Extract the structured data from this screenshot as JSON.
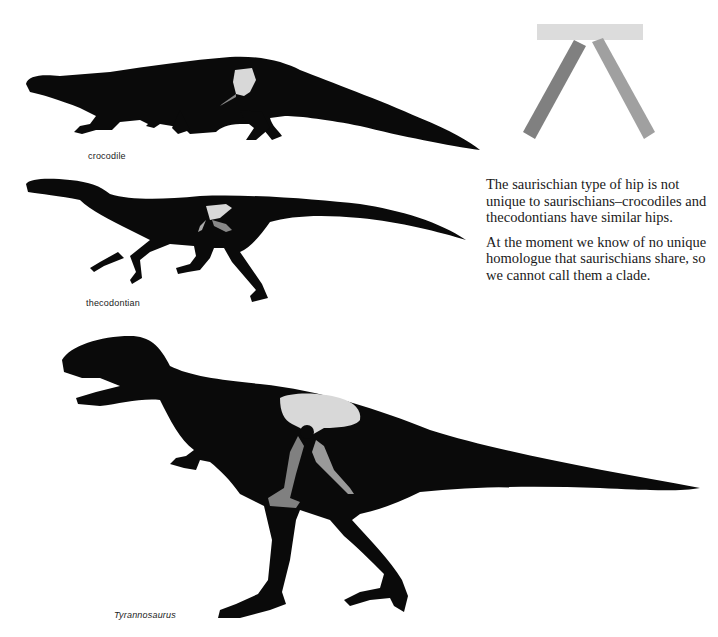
{
  "figures": {
    "crocodile": {
      "caption": "crocodile"
    },
    "thecodontian": {
      "caption": "thecodontian"
    },
    "tyrannosaurus": {
      "caption": "Tyrannosaurus"
    },
    "hip_diagram": {
      "label": "saurischian hip diagram"
    }
  },
  "text": {
    "paragraph_1": "The saurischian type of hip is not unique to saurischians–crocodiles and thecodontians have similar hips.",
    "paragraph_2": "At the moment we know of no unique homologue that saurischians share, so we cannot call them a clade."
  },
  "colors": {
    "silhouette": "#0a0a0a",
    "ilium": "#d8d8d8",
    "pubis": "#7a7a7a",
    "ischium": "#999999"
  }
}
